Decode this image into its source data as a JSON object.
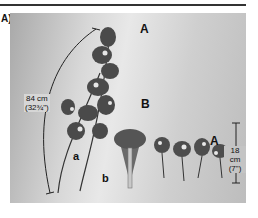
{
  "figure": {
    "panel_label": "A)",
    "labels": {
      "A_top": "A",
      "B": "B",
      "A_right": "A",
      "a": "a",
      "b": "b"
    },
    "measurements": {
      "long": {
        "metric": "84 cm",
        "imperial": "(32¾\")"
      },
      "short": {
        "metric": "18 cm",
        "imperial": "(7\")"
      }
    },
    "colors": {
      "rule": "#333333",
      "text": "#111111"
    }
  }
}
